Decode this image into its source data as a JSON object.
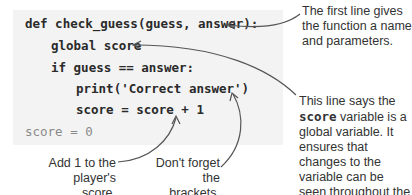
{
  "code": {
    "lines": [
      "def check_guess(guess, answer):",
      "global score",
      "if guess == answer:",
      "print('Correct answer')",
      "score = score + 1",
      "score = 0"
    ]
  },
  "annotations": {
    "first_line": "The first line gives the function a name and parameters.",
    "global_pre": "This line says the ",
    "global_var": "score",
    "global_post": " variable is a global variable. It ensures that changes to the variable can be seen throughout the whole program.",
    "add_one": "Add 1 to the player's score.",
    "brackets": "Don't forget the brackets."
  },
  "colors": {
    "code_background": "#f3f3f3",
    "code_text": "#2a2a2a",
    "arrow": "#555555"
  }
}
